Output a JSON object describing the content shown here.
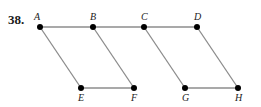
{
  "problem_number": "38.",
  "diagram": {
    "points": [
      {
        "label": "A",
        "x": 40,
        "y": 27,
        "label_dx": -6,
        "label_dy": -7
      },
      {
        "label": "B",
        "x": 93,
        "y": 27,
        "label_dx": -3,
        "label_dy": -7
      },
      {
        "label": "C",
        "x": 144,
        "y": 27,
        "label_dx": -3,
        "label_dy": -7
      },
      {
        "label": "D",
        "x": 197,
        "y": 27,
        "label_dx": -3,
        "label_dy": -7
      },
      {
        "label": "E",
        "x": 81,
        "y": 88,
        "label_dx": -3,
        "label_dy": 13
      },
      {
        "label": "F",
        "x": 134,
        "y": 88,
        "label_dx": -3,
        "label_dy": 13
      },
      {
        "label": "G",
        "x": 185,
        "y": 88,
        "label_dx": -3,
        "label_dy": 13
      },
      {
        "label": "H",
        "x": 238,
        "y": 88,
        "label_dx": -3,
        "label_dy": 13
      }
    ],
    "segments": [
      [
        "A",
        "D"
      ],
      [
        "E",
        "F"
      ],
      [
        "G",
        "H"
      ],
      [
        "A",
        "E"
      ],
      [
        "B",
        "F"
      ],
      [
        "C",
        "G"
      ],
      [
        "D",
        "H"
      ]
    ],
    "colors": {
      "line": "#8c8c8c",
      "point": "#000000",
      "label": "#222222"
    }
  }
}
